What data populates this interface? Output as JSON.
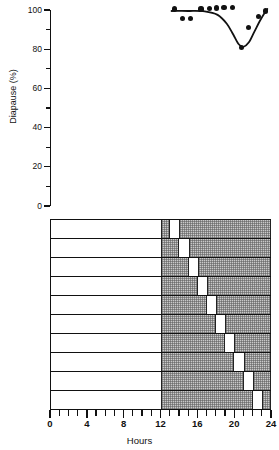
{
  "figure": {
    "caption_absent": true
  },
  "top_panel": {
    "y_axis": {
      "title": "Diapause (%)",
      "tick_labels": [
        "100",
        "80",
        "60",
        "40",
        "20",
        "0"
      ],
      "tick_values": [
        100,
        80,
        60,
        40,
        20,
        0
      ],
      "minor_tick_values": [
        90,
        70,
        50,
        30,
        10
      ],
      "min": 0,
      "max": 100
    }
  },
  "bottom_panel": {
    "x_axis": {
      "title": "Hours",
      "tick_labels": [
        "0",
        "4",
        "8",
        "12",
        "16",
        "20",
        "24"
      ],
      "tick_values": [
        0,
        4,
        8,
        12,
        16,
        20,
        24
      ],
      "min": 0,
      "max": 24,
      "minor_tick_step": 1
    },
    "rows_label": "light-dark schedules",
    "row_count": 10
  },
  "colors": {
    "ink": "#111111",
    "dark_block_fill": "#c9c9c9",
    "dark_block_stipple": "#5a5a5a",
    "background": "#ffffff"
  },
  "chart_data": {
    "type": "scatter",
    "title": "",
    "xlabel": "Hours",
    "ylabel": "Diapause (%)",
    "xlim": [
      0,
      24
    ],
    "ylim": [
      0,
      100
    ],
    "grid": false,
    "legend": "none",
    "series": [
      {
        "name": "Diapause incidence",
        "marker": "filled-circle",
        "x": [
          13.5,
          14.4,
          15.3,
          16.4,
          17.3,
          18.1,
          18.9,
          19.8,
          20.8,
          21.6,
          22.6,
          23.4
        ],
        "y": [
          100.5,
          95.5,
          95.5,
          100.5,
          100.8,
          101.0,
          101.2,
          101.2,
          81.0,
          91.0,
          96.5,
          99.5
        ],
        "values_note": "percentage of larvae entering diapause when the night was interrupted by a 1 h light pulse beginning at the indicated hour"
      },
      {
        "name": "fitted curve",
        "type": "line",
        "path_points_x": [
          13.2,
          15.0,
          16.8,
          18.2,
          19.2,
          19.9,
          20.5,
          21.0,
          21.6,
          22.2,
          22.8,
          23.3,
          23.6
        ],
        "path_points_y": [
          99.5,
          99.5,
          99.3,
          97.5,
          93.0,
          87.5,
          82.5,
          81.2,
          83.5,
          89.0,
          94.5,
          98.5,
          100.5
        ]
      }
    ],
    "schedule": {
      "type": "bar",
      "description": "Light/dark schedules; dark (stippled) bars span the scotophase from hour 12 to hour 24, each row interrupted by a 1 h light pulse that is delayed by 1 h in successive rows.",
      "dark_start": 12,
      "dark_end": 24,
      "light_start": 0,
      "rows": [
        {
          "row": 1,
          "interruption_start": 13,
          "interruption_end": 14
        },
        {
          "row": 2,
          "interruption_start": 14,
          "interruption_end": 15
        },
        {
          "row": 3,
          "interruption_start": 15,
          "interruption_end": 16
        },
        {
          "row": 4,
          "interruption_start": 16,
          "interruption_end": 17
        },
        {
          "row": 5,
          "interruption_start": 17,
          "interruption_end": 18
        },
        {
          "row": 6,
          "interruption_start": 18,
          "interruption_end": 19
        },
        {
          "row": 7,
          "interruption_start": 19,
          "interruption_end": 20
        },
        {
          "row": 8,
          "interruption_start": 20,
          "interruption_end": 21
        },
        {
          "row": 9,
          "interruption_start": 21,
          "interruption_end": 22
        },
        {
          "row": 10,
          "interruption_start": 22,
          "interruption_end": 23
        }
      ]
    }
  }
}
